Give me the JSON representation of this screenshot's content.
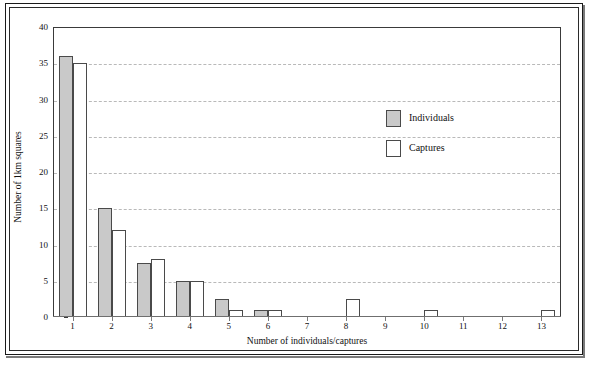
{
  "chart_data": {
    "type": "bar",
    "title": "",
    "subtitle": "",
    "xlabel": "Number of individuals/captures",
    "ylabel": "Number of 1km squares",
    "categories": [
      "1",
      "2",
      "3",
      "4",
      "5",
      "6",
      "7",
      "8",
      "9",
      "10",
      "11",
      "12",
      "13"
    ],
    "series": [
      {
        "name": "Individuals",
        "color": "#c9c9c9",
        "values": [
          36,
          15,
          7.5,
          5,
          2.5,
          1,
          0,
          0,
          0,
          0,
          0,
          0,
          0
        ]
      },
      {
        "name": "Captures",
        "color": "#ffffff",
        "values": [
          35,
          12,
          8,
          5,
          1,
          1,
          0,
          2.5,
          0,
          1,
          0,
          0,
          1
        ]
      }
    ],
    "ylim": [
      0,
      40
    ],
    "ytick_values": [
      0,
      5,
      10,
      15,
      20,
      25,
      30,
      35,
      40
    ],
    "ytick_labels": [
      "0",
      "5",
      "10",
      "15",
      "20",
      "25",
      "30",
      "35",
      "40"
    ],
    "grid": true,
    "grid_style": "dashed",
    "grid_color": "#b9b9b9",
    "legend_position": "upper-right-inside",
    "legend": [
      "Individuals",
      "Captures"
    ],
    "axis_color": "#3a3a3a",
    "bar_border_color": "#4a4a4a"
  },
  "figure": {
    "frame_color": "#1a1a1a",
    "background": "#ffffff"
  }
}
